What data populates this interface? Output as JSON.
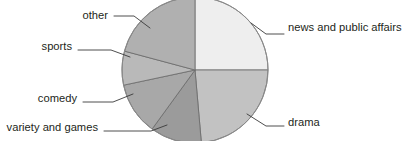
{
  "chart_data": {
    "type": "pie",
    "title": "",
    "subtitle": "",
    "xlabel": "",
    "ylabel": "",
    "grid": false,
    "legend_position": "labels-with-leader-lines",
    "center": {
      "x": 195,
      "y": 70
    },
    "radius": 73,
    "start_angle_deg": 0,
    "direction": "clockwise",
    "categories": [
      "news and public affairs",
      "drama",
      "variety and games",
      "comedy",
      "sports",
      "other"
    ],
    "values": [
      25,
      23.5,
      11.5,
      11.5,
      7.5,
      21
    ],
    "slices": [
      {
        "label": "news and public affairs",
        "value": 25,
        "start_deg": 0,
        "end_deg": 90,
        "color": "#eeeeee",
        "label_side": "right",
        "label_x": 288,
        "label_y": 31,
        "leader": "M 251,23 L 266,34 L 284,34"
      },
      {
        "label": "drama",
        "value": 23.5,
        "start_deg": 90,
        "end_deg": 175,
        "color": "#c2c2c2",
        "label_side": "right",
        "label_x": 288,
        "label_y": 126,
        "leader": "M 247,114 L 266,126 L 284,126"
      },
      {
        "label": "variety and games",
        "value": 11.5,
        "start_deg": 175,
        "end_deg": 216,
        "color": "#9b9b9b",
        "label_side": "left",
        "label_x": 98,
        "label_y": 131,
        "leader": "M 167,125 L 151,131 L 104,131"
      },
      {
        "label": "comedy",
        "value": 11.5,
        "start_deg": 216,
        "end_deg": 258,
        "color": "#a8a8a8",
        "label_side": "left",
        "label_x": 77,
        "label_y": 102,
        "leader": "M 133,94 L 113,102 L 83,102"
      },
      {
        "label": "sports",
        "value": 7.5,
        "start_deg": 258,
        "end_deg": 285,
        "color": "#b9b9b9",
        "label_side": "left",
        "label_x": 72,
        "label_y": 50,
        "leader": "M 130,57 L 111,50 L 78,50"
      },
      {
        "label": "other",
        "value": 21,
        "start_deg": 285,
        "end_deg": 360,
        "color": "#b0b0b0",
        "label_side": "left",
        "label_x": 108,
        "label_y": 19,
        "leader": "M 150,28 L 134,16 L 114,16"
      }
    ],
    "colors": [
      "#eeeeee",
      "#c2c2c2",
      "#9b9b9b",
      "#a8a8a8",
      "#b9b9b9",
      "#b0b0b0"
    ],
    "background": "#ffffff",
    "border_color": "#6a6a6a"
  }
}
